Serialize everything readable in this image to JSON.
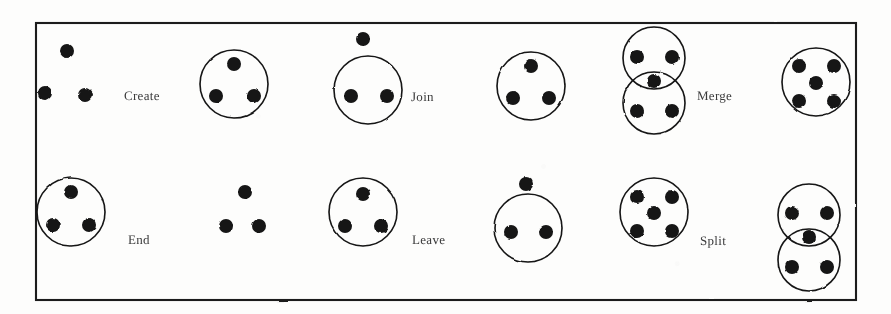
{
  "figure": {
    "border": {
      "x": 36,
      "y": 23,
      "width": 820,
      "height": 277,
      "color": "#1a1a1a"
    },
    "ink_color": "#141414",
    "background_color": "#fdfdfc",
    "dot_radius": 7,
    "circle_radius": 34
  },
  "operations": [
    {
      "id": "create",
      "label": "Create",
      "label_x": 124,
      "label_y": 88,
      "row": 1,
      "column": 1,
      "before": {
        "type": "free-dots",
        "dot_count": 3,
        "dots": [
          {
            "x": 67,
            "y": 51
          },
          {
            "x": 45,
            "y": 93
          },
          {
            "x": 85,
            "y": 95
          }
        ]
      },
      "arrow": {
        "x1": 105,
        "y1": 73,
        "x2": 188,
        "y2": 73
      },
      "after": {
        "type": "single-circle",
        "circle_count": 1,
        "dot_count": 3,
        "circles": [
          {
            "cx": 234,
            "cy": 84,
            "r": 34
          }
        ],
        "dots": [
          {
            "x": 234,
            "y": 64
          },
          {
            "x": 216,
            "y": 96
          },
          {
            "x": 254,
            "y": 96
          }
        ]
      }
    },
    {
      "id": "join",
      "label": "Join",
      "label_x": 411,
      "label_y": 89,
      "row": 1,
      "column": 2,
      "before": {
        "type": "circle-plus-outside-dot",
        "circle_count": 1,
        "dot_count": 3,
        "circles": [
          {
            "cx": 368,
            "cy": 90,
            "r": 34
          }
        ],
        "dots": [
          {
            "x": 351,
            "y": 96
          },
          {
            "x": 387,
            "y": 96
          },
          {
            "x": 363,
            "y": 39
          }
        ]
      },
      "arrow": {
        "x1": 405,
        "y1": 76,
        "x2": 487,
        "y2": 76
      },
      "after": {
        "type": "single-circle",
        "circle_count": 1,
        "dot_count": 3,
        "circles": [
          {
            "cx": 531,
            "cy": 86,
            "r": 34
          }
        ],
        "dots": [
          {
            "x": 531,
            "y": 66
          },
          {
            "x": 513,
            "y": 98
          },
          {
            "x": 549,
            "y": 98
          }
        ]
      }
    },
    {
      "id": "merge",
      "label": "Merge",
      "label_x": 697,
      "label_y": 88,
      "row": 1,
      "column": 3,
      "before": {
        "type": "two-overlapping-circles",
        "circle_count": 2,
        "dot_count": 5,
        "circles": [
          {
            "cx": 654,
            "cy": 58,
            "r": 31
          },
          {
            "cx": 654,
            "cy": 103,
            "r": 31
          }
        ],
        "dots": [
          {
            "x": 637,
            "y": 57
          },
          {
            "x": 672,
            "y": 57
          },
          {
            "x": 654,
            "y": 81
          },
          {
            "x": 637,
            "y": 111
          },
          {
            "x": 672,
            "y": 111
          }
        ]
      },
      "arrow": {
        "x1": 690,
        "y1": 70,
        "x2": 772,
        "y2": 70
      },
      "after": {
        "type": "single-circle",
        "circle_count": 1,
        "dot_count": 5,
        "circles": [
          {
            "cx": 816,
            "cy": 82,
            "r": 34
          }
        ],
        "dots": [
          {
            "x": 799,
            "y": 66
          },
          {
            "x": 834,
            "y": 66
          },
          {
            "x": 816,
            "y": 83
          },
          {
            "x": 799,
            "y": 101
          },
          {
            "x": 834,
            "y": 101
          }
        ]
      }
    },
    {
      "id": "end",
      "label": "End",
      "label_x": 128,
      "label_y": 232,
      "row": 2,
      "column": 1,
      "before": {
        "type": "single-circle",
        "circle_count": 1,
        "dot_count": 3,
        "circles": [
          {
            "cx": 71,
            "cy": 212,
            "r": 34
          }
        ],
        "dots": [
          {
            "x": 71,
            "y": 192
          },
          {
            "x": 53,
            "y": 225
          },
          {
            "x": 89,
            "y": 225
          }
        ]
      },
      "arrow": {
        "x1": 118,
        "y1": 209,
        "x2": 201,
        "y2": 209
      },
      "after": {
        "type": "free-dots",
        "dot_count": 3,
        "dots": [
          {
            "x": 245,
            "y": 192
          },
          {
            "x": 226,
            "y": 226
          },
          {
            "x": 259,
            "y": 226
          }
        ]
      }
    },
    {
      "id": "leave",
      "label": "Leave",
      "label_x": 412,
      "label_y": 232,
      "row": 2,
      "column": 2,
      "before": {
        "type": "single-circle",
        "circle_count": 1,
        "dot_count": 3,
        "circles": [
          {
            "cx": 363,
            "cy": 212,
            "r": 34
          }
        ],
        "dots": [
          {
            "x": 363,
            "y": 194
          },
          {
            "x": 345,
            "y": 226
          },
          {
            "x": 381,
            "y": 226
          }
        ]
      },
      "arrow": {
        "x1": 404,
        "y1": 213,
        "x2": 486,
        "y2": 213
      },
      "after": {
        "type": "circle-plus-outside-dot",
        "circle_count": 1,
        "dot_count": 3,
        "circles": [
          {
            "cx": 528,
            "cy": 228,
            "r": 34
          }
        ],
        "dots": [
          {
            "x": 511,
            "y": 232
          },
          {
            "x": 546,
            "y": 232
          },
          {
            "x": 526,
            "y": 184
          }
        ]
      }
    },
    {
      "id": "split",
      "label": "Split",
      "label_x": 700,
      "label_y": 233,
      "row": 2,
      "column": 3,
      "before": {
        "type": "single-circle",
        "circle_count": 1,
        "dot_count": 5,
        "circles": [
          {
            "cx": 654,
            "cy": 212,
            "r": 34
          }
        ],
        "dots": [
          {
            "x": 637,
            "y": 197
          },
          {
            "x": 672,
            "y": 197
          },
          {
            "x": 654,
            "y": 213
          },
          {
            "x": 637,
            "y": 231
          },
          {
            "x": 672,
            "y": 231
          }
        ]
      },
      "arrow": {
        "x1": 692,
        "y1": 209,
        "x2": 774,
        "y2": 209
      },
      "after": {
        "type": "two-overlapping-circles",
        "circle_count": 2,
        "dot_count": 5,
        "circles": [
          {
            "cx": 809,
            "cy": 215,
            "r": 31
          },
          {
            "cx": 809,
            "cy": 260,
            "r": 31
          }
        ],
        "dots": [
          {
            "x": 792,
            "y": 213
          },
          {
            "x": 827,
            "y": 213
          },
          {
            "x": 809,
            "y": 237
          },
          {
            "x": 792,
            "y": 267
          },
          {
            "x": 827,
            "y": 267
          }
        ]
      }
    }
  ]
}
